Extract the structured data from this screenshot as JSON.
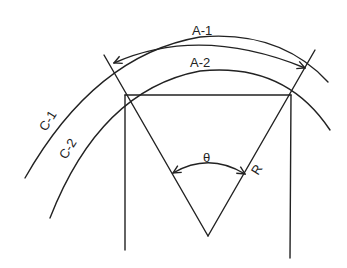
{
  "diagram": {
    "type": "geometry",
    "colors": {
      "line": "#222222",
      "background": "#ffffff"
    },
    "labels": {
      "arc_outer": "A-1",
      "arc_inner": "A-2",
      "circle_outer": "C-1",
      "circle_inner": "C-2",
      "angle": "θ",
      "radius": "R"
    },
    "elements": [
      {
        "id": "C-1",
        "kind": "circle-arc",
        "role": "outer circle"
      },
      {
        "id": "C-2",
        "kind": "circle-arc",
        "role": "inner circle"
      },
      {
        "id": "A-1",
        "kind": "dimension-arc",
        "role": "arc length on outer circle, arrows both ends"
      },
      {
        "id": "A-2",
        "kind": "arc-label",
        "role": "arc length on inner circle"
      },
      {
        "id": "chord",
        "kind": "line",
        "role": "horizontal chord across inner circle"
      },
      {
        "id": "radii",
        "kind": "lines",
        "role": "two radii from center meeting at vertex, extended to outer circle"
      },
      {
        "id": "verticals",
        "kind": "lines",
        "role": "two vertical lines dropping from chord endpoints"
      },
      {
        "id": "theta",
        "kind": "angle-arc",
        "role": "central angle between the radii, arrows both ends"
      },
      {
        "id": "R",
        "kind": "label",
        "role": "radius"
      }
    ]
  }
}
